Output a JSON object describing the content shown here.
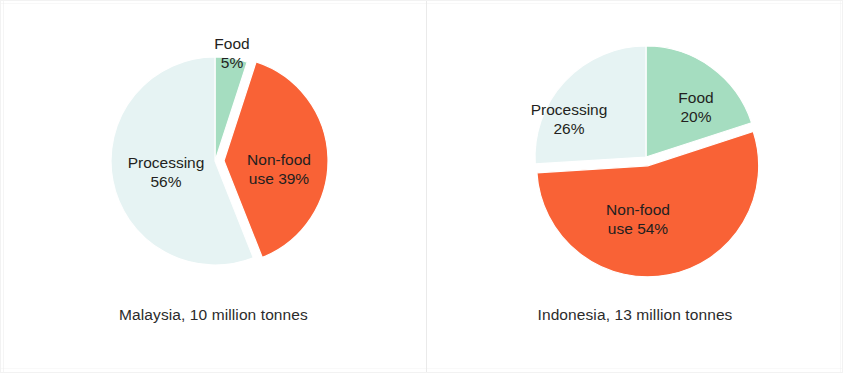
{
  "figure": {
    "background_color": "#ffffff",
    "divider_color": "#e6e6e6"
  },
  "palette": {
    "food": "#a5ddc0",
    "non_food": "#f96236",
    "processing": "#e6f3f3",
    "label_text": "#231f20",
    "caption_text": "#2b2b2b"
  },
  "charts": [
    {
      "id": "malaysia",
      "caption": "Malaysia, 10 million tonnes",
      "center": {
        "x": 214,
        "y": 160
      },
      "radius": 104,
      "slices": [
        {
          "key": "food",
          "name": "Food",
          "value": 5,
          "color": "#a5ddc0",
          "exploded": false,
          "label_lines": [
            "Food",
            "5%"
          ],
          "label_x": 231,
          "label_y": 44
        },
        {
          "key": "non_food",
          "name": "Non-food use",
          "value": 39,
          "color": "#f96236",
          "exploded": true,
          "label_lines": [
            "Non-food",
            "use 39%"
          ],
          "label_x": 278,
          "label_y": 160
        },
        {
          "key": "processing",
          "name": "Processing",
          "value": 56,
          "color": "#e6f3f3",
          "exploded": false,
          "label_lines": [
            "Processing",
            "56%"
          ],
          "label_x": 165,
          "label_y": 163
        }
      ]
    },
    {
      "id": "indonesia",
      "caption": "Indonesia, 13 million tonnes",
      "center": {
        "x": 220,
        "y": 156
      },
      "radius": 111,
      "slices": [
        {
          "key": "food",
          "name": "Food",
          "value": 20,
          "color": "#a5ddc0",
          "exploded": false,
          "label_lines": [
            "Food",
            "20%"
          ],
          "label_x": 270,
          "label_y": 98
        },
        {
          "key": "non_food",
          "name": "Non-food use",
          "value": 54,
          "color": "#f96236",
          "exploded": true,
          "label_lines": [
            "Non-food",
            "use 54%"
          ],
          "label_x": 212,
          "label_y": 210
        },
        {
          "key": "processing",
          "name": "Processing",
          "value": 26,
          "color": "#e6f3f3",
          "exploded": false,
          "label_lines": [
            "Processing",
            "26%"
          ],
          "label_x": 143,
          "label_y": 110
        }
      ]
    }
  ],
  "chart_data": [
    {
      "type": "pie",
      "title": "Malaysia, 10 million tonnes",
      "categories": [
        "Food",
        "Non-food use",
        "Processing"
      ],
      "values": [
        5,
        39,
        56
      ],
      "unit": "%",
      "total_label": "10 million tonnes",
      "colors": [
        "#a5ddc0",
        "#f96236",
        "#e6f3f3"
      ],
      "start_angle_deg": 0,
      "direction": "clockwise",
      "exploded_slices": [
        "Non-food use"
      ],
      "legend": "none",
      "labels_inline": true
    },
    {
      "type": "pie",
      "title": "Indonesia, 13 million tonnes",
      "categories": [
        "Food",
        "Non-food use",
        "Processing"
      ],
      "values": [
        20,
        54,
        26
      ],
      "unit": "%",
      "total_label": "13 million tonnes",
      "colors": [
        "#a5ddc0",
        "#f96236",
        "#e6f3f3"
      ],
      "start_angle_deg": 0,
      "direction": "clockwise",
      "exploded_slices": [
        "Non-food use"
      ],
      "legend": "none",
      "labels_inline": true
    }
  ]
}
